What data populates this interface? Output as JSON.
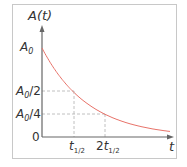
{
  "chart_data": {
    "type": "line",
    "title": "",
    "xlabel": "t",
    "ylabel": "A(t)",
    "y_ticks": [
      {
        "label": "A0",
        "sub": "0",
        "suffix": "",
        "value": 1.0
      },
      {
        "label": "A0/2",
        "sub": "0",
        "suffix": "/2",
        "value": 0.5
      },
      {
        "label": "A0/4",
        "sub": "0",
        "suffix": "/4",
        "value": 0.25
      },
      {
        "label": "0",
        "value": 0
      }
    ],
    "x_ticks": [
      {
        "label": "t1/2",
        "prefix": "",
        "sub": "1/2",
        "value": 1
      },
      {
        "label": "2t1/2",
        "prefix": "2",
        "sub": "1/2",
        "value": 2
      }
    ],
    "series": [
      {
        "name": "A(t) = A0 · 2^(-t/t1/2)",
        "color": "#e8736a",
        "x": [
          0,
          0.5,
          1,
          1.5,
          2,
          2.5,
          3,
          3.5,
          4
        ],
        "values": [
          1.0,
          0.707,
          0.5,
          0.354,
          0.25,
          0.177,
          0.125,
          0.088,
          0.0625
        ]
      }
    ],
    "guides": "dashed lines at (t1/2, A0/2) and (2t1/2, A0/4)",
    "xlim": [
      0,
      4.2
    ],
    "ylim": [
      0,
      1.1
    ],
    "grid": false,
    "legend": "none"
  },
  "axis": {
    "y_label_main": "A",
    "y_label_paren": "(t)",
    "x_label": "t",
    "origin": "0"
  },
  "colors": {
    "curve": "#e8736a",
    "axis": "#555555",
    "guide": "#aaaaaa",
    "frame": "#c8c8c8"
  }
}
